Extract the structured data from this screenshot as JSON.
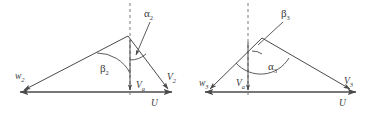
{
  "figure": {
    "stroke_color": "#4a4a4a",
    "text_color": "#3a3a3a",
    "background_color": "#ffffff"
  },
  "diagrams": [
    {
      "name": "velocity-triangle-2",
      "labels": {
        "alpha": "α",
        "alpha_sub": "2",
        "beta": "β",
        "beta_sub": "2",
        "w": "w",
        "w_sub": "2",
        "v": "V",
        "v_sub": "2",
        "va": "V",
        "va_sub": "a",
        "u": "U"
      }
    },
    {
      "name": "velocity-triangle-3",
      "labels": {
        "alpha": "α",
        "alpha_sub": "3",
        "beta": "β",
        "beta_sub": "3",
        "w": "w",
        "w_sub": "3",
        "v": "V",
        "v_sub": "3",
        "va": "V",
        "va_sub": "a",
        "u": "U"
      }
    }
  ]
}
